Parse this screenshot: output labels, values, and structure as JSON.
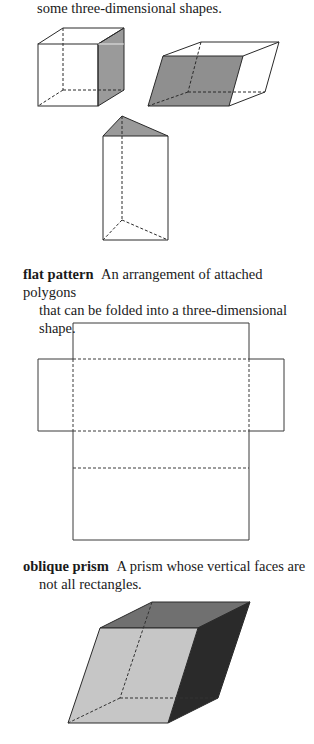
{
  "intro": {
    "line": "some three-dimensional shapes."
  },
  "entries": [
    {
      "term": "flat pattern",
      "definition_line1": "An arrangement of attached polygons",
      "definition_line2": "that can be folded into a three-dimensional shape."
    },
    {
      "term": "oblique prism",
      "definition_line1": "A prism whose vertical faces are",
      "definition_line2": "not all rectangles."
    }
  ],
  "figures": [
    {
      "name": "cube",
      "shaded_face": "right",
      "shade_color": "#9a9a9a"
    },
    {
      "name": "slanted-rectangular-prism",
      "shaded_face": "front",
      "shade_color": "#8f8f8f"
    },
    {
      "name": "triangular-prism",
      "shaded_face": "top",
      "shade_color": "#9a9a9a"
    },
    {
      "name": "flat-pattern-net",
      "fold_lines": "dashed"
    },
    {
      "name": "oblique-prism",
      "colors": {
        "front": "#c6c6c6",
        "top": "#707070",
        "side": "#2a2a2a"
      }
    }
  ],
  "colors": {
    "line": "#2a2a2a",
    "text": "#1a1a1a",
    "background": "#ffffff"
  }
}
